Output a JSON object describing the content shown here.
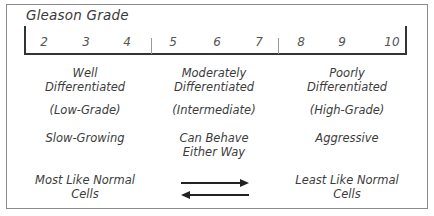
{
  "title": "Gleason Grade",
  "scale": {
    "ticks": [
      "2",
      "3",
      "4",
      "5",
      "6",
      "7",
      "8",
      "9",
      "10"
    ]
  },
  "columns": [
    {
      "differentiation": [
        "Well",
        "Differentiated"
      ],
      "grade_label": "(Low-Grade)",
      "behavior": [
        "Slow-Growing"
      ]
    },
    {
      "differentiation": [
        "Moderately",
        "Differentiated"
      ],
      "grade_label": "(Intermediate)",
      "behavior": [
        "Can Behave",
        "Either Way"
      ]
    },
    {
      "differentiation": [
        "Poorly",
        "Differentiated"
      ],
      "grade_label": "(High-Grade)",
      "behavior": [
        "Aggressive"
      ]
    }
  ],
  "bottom": {
    "left": [
      "Most Like Normal",
      "Cells"
    ],
    "right": [
      "Least Like Normal",
      "Cells"
    ],
    "arrows": [
      "right-arrow",
      "left-arrow"
    ]
  }
}
